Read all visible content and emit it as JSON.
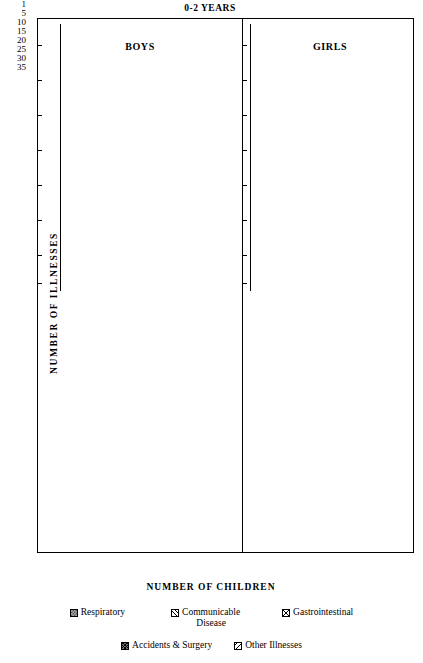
{
  "chart_data": {
    "type": "bar",
    "title": "0-2 YEARS",
    "xlabel": "NUMBER OF CHILDREN",
    "ylabel": "NUMBER OF ILLNESSES",
    "orientation": "horizontal",
    "xlim": [
      0,
      28
    ],
    "xticks": [
      1,
      5,
      10,
      15,
      20,
      25
    ],
    "xtick_labels": [
      "1",
      "",
      "10",
      "",
      "20",
      ""
    ],
    "grid": false,
    "legend_position": "bottom",
    "panel_headers": [
      "BOYS",
      "GIRLS"
    ],
    "legend": [
      {
        "name": "Respiratory",
        "pattern": "checker-gray"
      },
      {
        "name": "Communicable Disease",
        "pattern": "diagonal-up"
      },
      {
        "name": "Gastrointestinal",
        "pattern": "cross-hatch"
      },
      {
        "name": "Accidents & Surgery",
        "pattern": "dark-cross-hatch"
      },
      {
        "name": "Other Illnesses",
        "pattern": "diagonal-down"
      }
    ],
    "panels": [
      {
        "id": "respiratory",
        "category": "Respiratory",
        "yticks": [
          1,
          5,
          10,
          15,
          20,
          25,
          30,
          35
        ],
        "ylim": [
          0,
          38
        ],
        "series": [
          {
            "name": "BOYS",
            "points": [
              {
                "illnesses": 20,
                "children": 1
              },
              {
                "illnesses": 17,
                "children": 1
              },
              {
                "illnesses": 16,
                "children": 1
              },
              {
                "illnesses": 15,
                "children": 1
              },
              {
                "illnesses": 14,
                "children": 1
              },
              {
                "illnesses": 13,
                "children": 1
              },
              {
                "illnesses": 12,
                "children": 2
              },
              {
                "illnesses": 11,
                "children": 3
              },
              {
                "illnesses": 10,
                "children": 3
              },
              {
                "illnesses": 9,
                "children": 3
              },
              {
                "illnesses": 8,
                "children": 1
              },
              {
                "illnesses": 7,
                "children": 12
              },
              {
                "illnesses": 6,
                "children": 8
              },
              {
                "illnesses": 5,
                "children": 7
              },
              {
                "illnesses": 4,
                "children": 9
              },
              {
                "illnesses": 3,
                "children": 7
              },
              {
                "illnesses": 2,
                "children": 8
              },
              {
                "illnesses": 1,
                "children": 5
              }
            ]
          },
          {
            "name": "GIRLS",
            "points": [
              {
                "illnesses": 15,
                "children": 2
              },
              {
                "illnesses": 14,
                "children": 2
              },
              {
                "illnesses": 12,
                "children": 1
              },
              {
                "illnesses": 11,
                "children": 3
              },
              {
                "illnesses": 10,
                "children": 2
              },
              {
                "illnesses": 9,
                "children": 2
              },
              {
                "illnesses": 8,
                "children": 4
              },
              {
                "illnesses": 7,
                "children": 3
              },
              {
                "illnesses": 6,
                "children": 13
              },
              {
                "illnesses": 5,
                "children": 11
              },
              {
                "illnesses": 4,
                "children": 3
              },
              {
                "illnesses": 3,
                "children": 3
              },
              {
                "illnesses": 2,
                "children": 7
              },
              {
                "illnesses": 1,
                "children": 3
              }
            ]
          }
        ]
      },
      {
        "id": "communicable",
        "category": "Communicable Disease",
        "yticks": [
          1,
          5
        ],
        "ylim": [
          0,
          7
        ],
        "series": [
          {
            "name": "BOYS",
            "points": [
              {
                "illnesses": 2,
                "children": 1
              },
              {
                "illnesses": 1,
                "children": 14
              }
            ]
          },
          {
            "name": "GIRLS",
            "points": [
              {
                "illnesses": 2,
                "children": 2
              },
              {
                "illnesses": 1,
                "children": 14
              }
            ]
          }
        ]
      },
      {
        "id": "gastrointestinal",
        "category": "Gastrointestinal",
        "yticks": [
          1,
          5,
          10
        ],
        "ylim": [
          0,
          13
        ],
        "series": [
          {
            "name": "BOYS",
            "points": [
              {
                "illnesses": 3,
                "children": 3
              },
              {
                "illnesses": 2,
                "children": 10
              },
              {
                "illnesses": 1,
                "children": 15
              }
            ]
          },
          {
            "name": "GIRLS",
            "points": [
              {
                "illnesses": 3,
                "children": 2
              },
              {
                "illnesses": 2,
                "children": 8
              },
              {
                "illnesses": 1,
                "children": 14
              }
            ]
          }
        ]
      },
      {
        "id": "accidents",
        "category": "Accidents & Surgery",
        "yticks": [
          1
        ],
        "ylim": [
          0,
          3
        ],
        "series": [
          {
            "name": "BOYS",
            "points": [
              {
                "illnesses": 1,
                "children": 1
              }
            ]
          },
          {
            "name": "GIRLS",
            "points": [
              {
                "illnesses": 1,
                "children": 3
              }
            ]
          }
        ]
      },
      {
        "id": "other",
        "category": "Other Illnesses",
        "yticks": [
          1,
          5
        ],
        "ylim": [
          0,
          7
        ],
        "series": [
          {
            "name": "BOYS",
            "points": [
              {
                "illnesses": 2,
                "children": 1
              },
              {
                "illnesses": 1,
                "children": 15
              }
            ]
          },
          {
            "name": "GIRLS",
            "points": [
              {
                "illnesses": 2,
                "children": 1
              },
              {
                "illnesses": 1,
                "children": 16
              }
            ]
          }
        ]
      }
    ]
  }
}
